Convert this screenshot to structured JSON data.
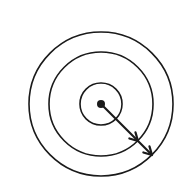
{
  "diagram": {
    "title": "",
    "type": "concentric-circles-with-radial-arrow",
    "canvas": {
      "width": 174,
      "height": 190,
      "background": "#ffffff"
    },
    "stroke_color": "#1a1a1a",
    "center": {
      "x": 101,
      "y": 104
    },
    "center_dot_radius": 4,
    "circles": [
      {
        "name": "inner-circle",
        "r": 21
      },
      {
        "name": "middle-circle",
        "r": 52
      },
      {
        "name": "outer-circle",
        "r": 72
      }
    ],
    "arrow": {
      "from": {
        "x": 101,
        "y": 104
      },
      "to": {
        "x": 152,
        "y": 155
      },
      "arrowheads_at": [
        {
          "x": 138,
          "y": 141
        },
        {
          "x": 152,
          "y": 155
        }
      ]
    },
    "labels": []
  }
}
